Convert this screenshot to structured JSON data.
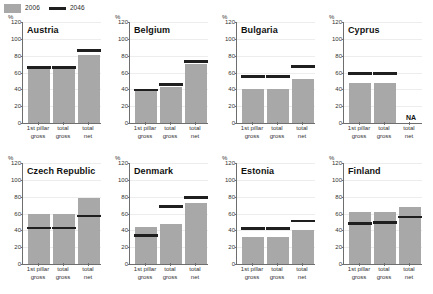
{
  "legend": {
    "items": [
      {
        "label": "2006",
        "type": "area-swatch",
        "color": "#a8a8a8"
      },
      {
        "label": "2046",
        "type": "line-swatch",
        "color": "#1f1f1f"
      }
    ]
  },
  "axis": {
    "unit": "%",
    "yticks": [
      0,
      20,
      40,
      60,
      80,
      100,
      120
    ],
    "ylim": [
      0,
      120
    ],
    "categories": [
      {
        "line1": "1st pillar",
        "line2": "gross"
      },
      {
        "line1": "total",
        "line2": "gross"
      },
      {
        "line1": "total",
        "line2": "net"
      }
    ]
  },
  "na_text": "NA",
  "chart_data": {
    "type": "bar",
    "title": "",
    "subtitle": "",
    "xlabel": "",
    "ylabel": "%",
    "ylim": [
      0,
      120
    ],
    "yticks": [
      0,
      20,
      40,
      60,
      80,
      100,
      120
    ],
    "grid": true,
    "legend_position": "top-left",
    "categories": [
      "1st pillar gross",
      "total gross",
      "total net"
    ],
    "series": [
      {
        "name": "2006",
        "render": "bar",
        "color": "#a8a8a8"
      },
      {
        "name": "2046",
        "render": "marker-line",
        "color": "#1f1f1f"
      }
    ],
    "panels": [
      {
        "name": "Austria",
        "values_2006": [
          64,
          64,
          81
        ],
        "values_2046": [
          66,
          66,
          86
        ],
        "na": []
      },
      {
        "name": "Belgium",
        "values_2006": [
          38,
          43,
          70
        ],
        "values_2046": [
          39,
          46,
          73
        ],
        "na": []
      },
      {
        "name": "Bulgaria",
        "values_2006": [
          41,
          41,
          52
        ],
        "values_2046": [
          55,
          55,
          67
        ],
        "na": []
      },
      {
        "name": "Cyprus",
        "values_2006": [
          48,
          48,
          null
        ],
        "values_2046": [
          59,
          59,
          null
        ],
        "na": [
          "total net"
        ]
      },
      {
        "name": "Czech Republic",
        "values_2006": [
          59,
          59,
          78
        ],
        "values_2046": [
          43,
          43,
          57
        ],
        "na": []
      },
      {
        "name": "Denmark",
        "values_2006": [
          44,
          48,
          72
        ],
        "values_2046": [
          34,
          68,
          79
        ],
        "na": []
      },
      {
        "name": "Estonia",
        "values_2006": [
          32,
          32,
          41
        ],
        "values_2046": [
          42,
          42,
          51
        ],
        "na": []
      },
      {
        "name": "Finland",
        "values_2006": [
          62,
          62,
          68
        ],
        "values_2046": [
          48,
          49,
          56
        ],
        "na": []
      }
    ]
  }
}
